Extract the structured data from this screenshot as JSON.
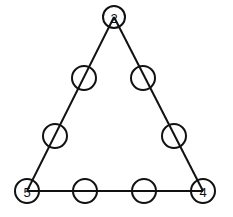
{
  "diagram": {
    "type": "triangle-number-puzzle",
    "canvas": {
      "width": 233,
      "height": 217
    },
    "colors": {
      "stroke": "#111111",
      "background": "#ffffff"
    },
    "edges": [
      {
        "from": "top",
        "to": "bottom-left"
      },
      {
        "from": "top",
        "to": "bottom-right"
      },
      {
        "from": "bottom-left",
        "to": "bottom-right"
      }
    ],
    "nodes": [
      {
        "id": "top",
        "x": 114,
        "y": 17,
        "r": 11,
        "label": "2"
      },
      {
        "id": "left-upper",
        "x": 84,
        "y": 78,
        "r": 12,
        "label": ""
      },
      {
        "id": "right-upper",
        "x": 143,
        "y": 78,
        "r": 12,
        "label": ""
      },
      {
        "id": "left-lower",
        "x": 55,
        "y": 136,
        "r": 12,
        "label": ""
      },
      {
        "id": "right-lower",
        "x": 174,
        "y": 136,
        "r": 12,
        "label": ""
      },
      {
        "id": "bottom-left",
        "x": 27,
        "y": 191,
        "r": 12,
        "label": "5"
      },
      {
        "id": "bottom-mid-left",
        "x": 85,
        "y": 191,
        "r": 12,
        "label": ""
      },
      {
        "id": "bottom-mid-right",
        "x": 144,
        "y": 191,
        "r": 12,
        "label": ""
      },
      {
        "id": "bottom-right",
        "x": 203,
        "y": 191,
        "r": 12,
        "label": "4"
      }
    ]
  }
}
